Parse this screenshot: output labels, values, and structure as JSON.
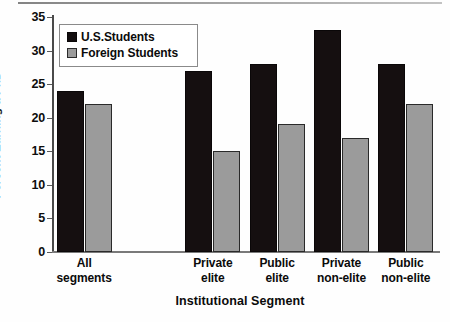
{
  "chart_data": {
    "type": "bar",
    "title": "",
    "xlabel": "Institutional Segment",
    "ylabel": "Percent Earning a PhD",
    "categories": [
      "All segments",
      "Private elite",
      "Public elite",
      "Private non-elite",
      "Public non-elite"
    ],
    "category_lines": [
      [
        "All",
        "segments"
      ],
      [
        "Private",
        "elite"
      ],
      [
        "Public",
        "elite"
      ],
      [
        "Private",
        "non-elite"
      ],
      [
        "Public",
        "non-elite"
      ]
    ],
    "series": [
      {
        "name": "U.S.Students",
        "color": "#150f10",
        "values": [
          24,
          27,
          28,
          33,
          28
        ]
      },
      {
        "name": "Foreign Students",
        "color": "#9b9b9b",
        "values": [
          22,
          15,
          19,
          17,
          22
        ]
      }
    ],
    "ylim": [
      0,
      35
    ],
    "ytick_step": 5,
    "yticks": [
      0,
      5,
      10,
      15,
      20,
      25,
      30,
      35
    ],
    "ytick_labels": [
      "0",
      "5",
      "10",
      "15",
      "20",
      "25",
      "30",
      "35"
    ],
    "grid": false,
    "legend_position": "top-left",
    "gap_after_first_group": true
  },
  "legend": {
    "items": [
      {
        "label": "U.S.Students",
        "swatch": "black-square-icon"
      },
      {
        "label": "Foreign Students",
        "swatch": "gray-square-icon"
      }
    ]
  }
}
